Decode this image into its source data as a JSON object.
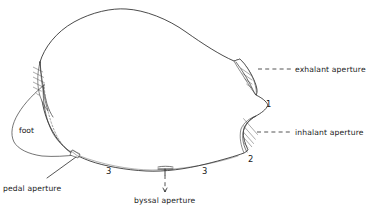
{
  "figure": {
    "background_color": "#ffffff",
    "line_color": "#2a2a2a",
    "width": 370,
    "height": 207
  },
  "labels": {
    "exhalant_aperture": "exhalant  aperture",
    "inhalant_aperture": "inhalant  aperture",
    "pedal_aperture": "pedal aperture",
    "byssal_aperture": "byssal aperture",
    "foot": "foot"
  },
  "numbers": {
    "one": "1",
    "two": "2",
    "three_left": "3",
    "three_right": "3"
  },
  "annotations": [
    {
      "id": "exhalant",
      "label": "exhalant  aperture",
      "leader": "dashed",
      "anchor_x": 258,
      "anchor_y": 68,
      "text_x": 293,
      "text_y": 70
    },
    {
      "id": "inhalant",
      "label": "inhalant  aperture",
      "leader": "dashed",
      "anchor_x": 257,
      "anchor_y": 131,
      "text_x": 293,
      "text_y": 133
    },
    {
      "id": "pedal",
      "label": "pedal aperture",
      "leader": "solid",
      "anchor_x": 76,
      "anchor_y": 157,
      "text_x": 3,
      "text_y": 188
    },
    {
      "id": "byssal",
      "label": "byssal aperture",
      "leader": "dashed",
      "anchor_x": 165,
      "anchor_y": 170,
      "text_x": 133,
      "text_y": 202
    }
  ],
  "markers": [
    {
      "id": "notch-1",
      "value": "1",
      "x": 268,
      "y": 103
    },
    {
      "id": "margin-2",
      "value": "2",
      "x": 250,
      "y": 159
    },
    {
      "id": "margin-3-left",
      "value": "3",
      "x": 108,
      "y": 171
    },
    {
      "id": "margin-3-right",
      "value": "3",
      "x": 204,
      "y": 171
    }
  ]
}
